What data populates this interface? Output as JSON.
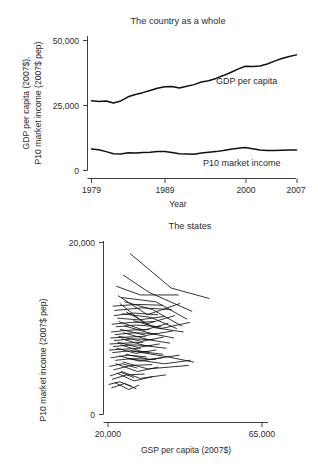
{
  "figure": {
    "background": "#ffffff",
    "line_color": "#111111",
    "axis_color": "#2b2b2b",
    "cropped_header_text": ""
  },
  "chart_data": [
    {
      "type": "line",
      "panel_name": "country-as-a-whole",
      "title": "The country as a whole",
      "xlabel": "Year",
      "ylabel": "GDP per capita (2007$),\nP10 market income (2007$ pep)",
      "ylabel_line1": "GDP per capita (2007$),",
      "ylabel_line2": "P10 market income (2007$ pep)",
      "xlim": [
        1979,
        2007
      ],
      "ylim": [
        0,
        52000
      ],
      "xticks": [
        1979,
        1989,
        2000,
        2007
      ],
      "xtick_labels": [
        "1979",
        "1989",
        "2000",
        "2007"
      ],
      "yticks": [
        0,
        25000,
        50000
      ],
      "ytick_labels": [
        "0",
        "25,000",
        "50,000"
      ],
      "grid": false,
      "legend_position": "inline-annotation",
      "x": [
        1979,
        1980,
        1981,
        1982,
        1983,
        1984,
        1985,
        1986,
        1987,
        1988,
        1989,
        1990,
        1991,
        1992,
        1993,
        1994,
        1995,
        1996,
        1997,
        1998,
        1999,
        2000,
        2001,
        2002,
        2003,
        2004,
        2005,
        2006,
        2007
      ],
      "series": [
        {
          "name": "GDP per capita",
          "label": "GDP per capita",
          "values": [
            27000,
            26700,
            26900,
            26100,
            26900,
            28500,
            29400,
            30100,
            30900,
            31800,
            32400,
            32500,
            31900,
            32600,
            33200,
            34200,
            34700,
            35600,
            36700,
            37900,
            39200,
            40300,
            40200,
            40400,
            41200,
            42300,
            43300,
            44100,
            44700
          ]
        },
        {
          "name": "P10 market income",
          "label": "P10 market income",
          "values": [
            8300,
            8000,
            7300,
            6500,
            6400,
            6900,
            6800,
            7000,
            7100,
            7300,
            7300,
            7000,
            6500,
            6400,
            6300,
            6800,
            7100,
            7300,
            7700,
            8200,
            8600,
            8900,
            8400,
            7900,
            7700,
            7700,
            7800,
            7900,
            7900
          ]
        }
      ]
    },
    {
      "type": "line",
      "panel_name": "the-states",
      "title": "The states",
      "xlabel": "GSP per capita (2007$)",
      "ylabel": "P10 market income (2007$ pep)",
      "xlim": [
        20000,
        65000
      ],
      "ylim": [
        0,
        20000
      ],
      "xticks": [
        20000,
        65000
      ],
      "xtick_labels": [
        "20,000",
        "65,000"
      ],
      "yticks": [
        0,
        20000
      ],
      "ytick_labels": [
        "0",
        "20,000"
      ],
      "grid": false,
      "legend_position": "none",
      "note": "Each polyline is one state's trajectory of P10 market income vs GSP per capita",
      "state_paths": [
        [
          [
            26500,
            18700
          ],
          [
            38500,
            14700
          ],
          [
            49500,
            13500
          ]
        ],
        [
          [
            24500,
            16200
          ],
          [
            32000,
            14200
          ],
          [
            44500,
            12000
          ]
        ],
        [
          [
            22500,
            14900
          ],
          [
            29500,
            13900
          ],
          [
            40500,
            13900
          ]
        ],
        [
          [
            23000,
            13800
          ],
          [
            31500,
            11600
          ],
          [
            41000,
            12900
          ]
        ],
        [
          [
            24000,
            13600
          ],
          [
            34000,
            13100
          ],
          [
            43000,
            11100
          ]
        ],
        [
          [
            21500,
            12600
          ],
          [
            28500,
            12800
          ],
          [
            36000,
            12700
          ]
        ],
        [
          [
            22000,
            12100
          ],
          [
            30000,
            12400
          ],
          [
            38500,
            12200
          ]
        ],
        [
          [
            23500,
            12900
          ],
          [
            31000,
            10500
          ],
          [
            39500,
            11500
          ]
        ],
        [
          [
            25000,
            13100
          ],
          [
            33000,
            12200
          ],
          [
            41500,
            10300
          ]
        ],
        [
          [
            21800,
            11500
          ],
          [
            27500,
            11800
          ],
          [
            34500,
            11600
          ]
        ],
        [
          [
            22800,
            11200
          ],
          [
            29000,
            11000
          ],
          [
            36500,
            11400
          ]
        ],
        [
          [
            24200,
            11700
          ],
          [
            32500,
            11300
          ],
          [
            40000,
            10000
          ]
        ],
        [
          [
            21200,
            10500
          ],
          [
            26500,
            10700
          ],
          [
            33500,
            10800
          ]
        ],
        [
          [
            22400,
            10200
          ],
          [
            28000,
            10400
          ],
          [
            35500,
            10200
          ]
        ],
        [
          [
            23200,
            10800
          ],
          [
            30500,
            9800
          ],
          [
            37500,
            10600
          ]
        ],
        [
          [
            25500,
            11900
          ],
          [
            33500,
            10100
          ],
          [
            42000,
            9600
          ]
        ],
        [
          [
            21000,
            9600
          ],
          [
            26000,
            9800
          ],
          [
            32000,
            9900
          ]
        ],
        [
          [
            22100,
            9300
          ],
          [
            27800,
            9500
          ],
          [
            34200,
            9400
          ]
        ],
        [
          [
            23600,
            9900
          ],
          [
            31200,
            9200
          ],
          [
            38800,
            9700
          ]
        ],
        [
          [
            24800,
            10300
          ],
          [
            32800,
            9400
          ],
          [
            39200,
            8900
          ]
        ],
        [
          [
            20800,
            8900
          ],
          [
            25500,
            9000
          ],
          [
            31000,
            9100
          ]
        ],
        [
          [
            21900,
            8600
          ],
          [
            27200,
            8800
          ],
          [
            33200,
            8700
          ]
        ],
        [
          [
            23100,
            9100
          ],
          [
            29800,
            8500
          ],
          [
            36200,
            9000
          ]
        ],
        [
          [
            24600,
            9500
          ],
          [
            31800,
            8700
          ],
          [
            38000,
            8300
          ]
        ],
        [
          [
            20600,
            8200
          ],
          [
            25000,
            8300
          ],
          [
            30200,
            8400
          ]
        ],
        [
          [
            21600,
            7900
          ],
          [
            26800,
            8100
          ],
          [
            32600,
            8000
          ]
        ],
        [
          [
            22900,
            8400
          ],
          [
            28800,
            7800
          ],
          [
            35000,
            8200
          ]
        ],
        [
          [
            24100,
            8800
          ],
          [
            30800,
            8000
          ],
          [
            37000,
            7700
          ]
        ],
        [
          [
            20400,
            7500
          ],
          [
            24600,
            7600
          ],
          [
            29500,
            7700
          ]
        ],
        [
          [
            21400,
            7200
          ],
          [
            26200,
            7400
          ],
          [
            31800,
            7300
          ]
        ],
        [
          [
            22600,
            7700
          ],
          [
            28200,
            7100
          ],
          [
            34000,
            7500
          ]
        ],
        [
          [
            23800,
            8100
          ],
          [
            30000,
            7300
          ],
          [
            36000,
            7000
          ]
        ],
        [
          [
            20900,
            6600
          ],
          [
            25800,
            6900
          ],
          [
            31200,
            6700
          ]
        ],
        [
          [
            22200,
            6300
          ],
          [
            27000,
            6500
          ],
          [
            33800,
            6400
          ]
        ],
        [
          [
            23400,
            6800
          ],
          [
            29200,
            6200
          ],
          [
            35800,
            6600
          ]
        ],
        [
          [
            25200,
            7000
          ],
          [
            32200,
            6400
          ],
          [
            40800,
            6900
          ]
        ],
        [
          [
            20500,
            5600
          ],
          [
            24200,
            5900
          ],
          [
            28500,
            5400
          ]
        ],
        [
          [
            21700,
            5200
          ],
          [
            26600,
            5700
          ],
          [
            32800,
            5800
          ]
        ],
        [
          [
            22300,
            5900
          ],
          [
            28600,
            5000
          ],
          [
            34600,
            5500
          ]
        ],
        [
          [
            24400,
            6100
          ],
          [
            31600,
            5300
          ],
          [
            43500,
            5700
          ]
        ],
        [
          [
            20700,
            4500
          ],
          [
            23800,
            4900
          ],
          [
            27500,
            4300
          ]
        ],
        [
          [
            21300,
            4100
          ],
          [
            25400,
            4600
          ],
          [
            30600,
            4700
          ]
        ],
        [
          [
            22700,
            4800
          ],
          [
            27600,
            3900
          ],
          [
            33000,
            4400
          ]
        ],
        [
          [
            23900,
            5000
          ],
          [
            29400,
            4200
          ],
          [
            36800,
            4600
          ]
        ],
        [
          [
            20300,
            3500
          ],
          [
            23400,
            3800
          ],
          [
            26800,
            3300
          ]
        ],
        [
          [
            21100,
            3100
          ],
          [
            24800,
            3600
          ],
          [
            28200,
            3000
          ]
        ],
        [
          [
            22050,
            3700
          ],
          [
            26050,
            2900
          ],
          [
            29000,
            3400
          ]
        ],
        [
          [
            25800,
            6500
          ],
          [
            36500,
            5900
          ],
          [
            44000,
            6300
          ]
        ],
        [
          [
            26800,
            7400
          ],
          [
            37500,
            6700
          ],
          [
            45000,
            6100
          ]
        ],
        [
          [
            27500,
            10900
          ],
          [
            35500,
            10000
          ],
          [
            43800,
            10700
          ]
        ]
      ]
    }
  ]
}
